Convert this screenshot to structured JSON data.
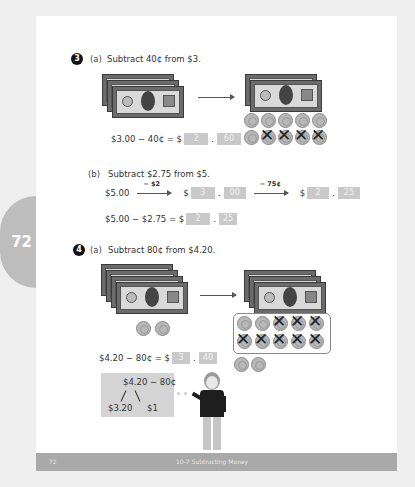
{
  "page_number_tab": "72",
  "problem3": {
    "number": "3",
    "part_a": {
      "label": "(a)",
      "prompt": "Subtract 40¢ from $3.",
      "equation_lhs": "$3.00 − 40¢ = $",
      "answer_dollars": "2",
      "answer_cents": "60",
      "before": {
        "bills": 3,
        "bill_value": "$1"
      },
      "after": {
        "bills": 2,
        "coins": 10,
        "coin_value": "10¢",
        "crossed_coins": 4
      }
    },
    "part_b": {
      "label": "(b)",
      "prompt": "Subtract $2.75 from $5.",
      "start": "$5.00",
      "step1_label": "− $2",
      "step1_dollars": "3",
      "step1_cents": "00",
      "step2_label": "− 75¢",
      "step2_dollars": "2",
      "step2_cents": "25",
      "dollar_sign": "$",
      "equation_lhs": "$5.00 − $2.75 = $",
      "answer_dollars": "2",
      "answer_cents": "25"
    }
  },
  "problem4": {
    "number": "4",
    "part_a": {
      "label": "(a)",
      "prompt": "Subtract 80¢ from $4.20.",
      "equation_lhs": "$4.20 − 80¢ = $",
      "answer_dollars": "3",
      "answer_cents": "40",
      "before": {
        "bills": 4,
        "coins": 2
      },
      "after": {
        "bills": 3,
        "boxed_coins": 10,
        "crossed_coins": 8,
        "extra_coins": 2
      },
      "think": {
        "top": "$4.20 − 80¢",
        "left": "$3.20",
        "right": "$1"
      }
    }
  },
  "footer": {
    "page": "72",
    "section": "10-7  Subtracting Money"
  }
}
